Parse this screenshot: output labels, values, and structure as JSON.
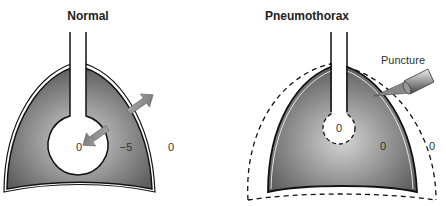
{
  "panels": [
    {
      "title": "Normal",
      "labels": {
        "alveolar_pressure": "0",
        "pleural_pressure": "−5",
        "atmospheric_pressure": "0"
      }
    },
    {
      "title": "Pneumothorax",
      "labels": {
        "alveolar_pressure": "0",
        "pleural_pressure": "0",
        "atmospheric_pressure": "0",
        "puncture": "Puncture"
      }
    }
  ],
  "colors": {
    "lung_fill_dark": "#5a5a5a",
    "lung_fill_light": "#d0d0d0",
    "outline": "#111111",
    "arrow_fill": "#8a8a8a"
  }
}
